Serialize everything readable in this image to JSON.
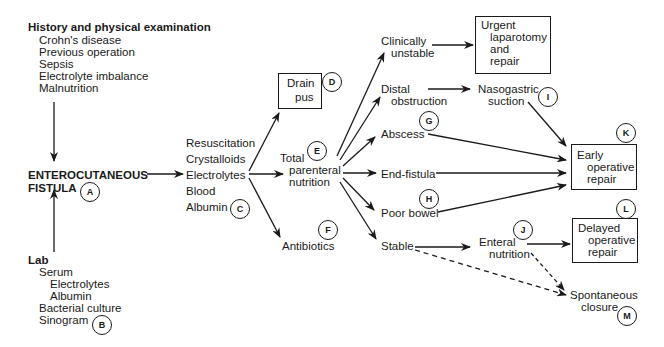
{
  "history": {
    "title": "History and physical examination",
    "items": [
      "Crohn's disease",
      "Previous operation",
      "Sepsis",
      "Electrolyte imbalance",
      "Malnutrition"
    ]
  },
  "fistula": {
    "line1": "ENTEROCUTANEOUS",
    "line2": "FISTULA",
    "label": "A"
  },
  "lab": {
    "title": "Lab",
    "serum": "Serum",
    "serum_items": [
      "Electrolytes",
      "Albumin"
    ],
    "items": [
      "Bacterial culture",
      "Sinogram"
    ],
    "label": "B"
  },
  "resuscitation": {
    "items": [
      "Resuscitation",
      "Crystalloids",
      "Electrolytes",
      "Blood",
      "Albumin"
    ],
    "label": "C"
  },
  "drain": {
    "line1": "Drain",
    "line2": "pus",
    "label": "D"
  },
  "tpn": {
    "line1": "Total",
    "line2": "parenteral",
    "line3": "nutrition",
    "label": "E"
  },
  "antibiotics": {
    "text": "Antibiotics",
    "label": "F"
  },
  "branches": {
    "unstable": {
      "line1": "Clinically",
      "line2": "unstable"
    },
    "obstruction": {
      "line1": "Distal",
      "line2": "obstruction"
    },
    "abscess": {
      "text": "Abscess",
      "label": "G"
    },
    "endfistula": {
      "text": "End-fistula"
    },
    "poorbowel": {
      "text": "Poor bowel",
      "label": "H"
    },
    "stable": {
      "text": "Stable"
    }
  },
  "urgent": {
    "line1": "Urgent",
    "line2": "laparotomy",
    "line3": "and",
    "line4": "repair"
  },
  "nasogastric": {
    "line1": "Nasogastric",
    "line2": "suction",
    "label": "I"
  },
  "enteral": {
    "line1": "Enteral",
    "line2": "nutrition",
    "label": "J"
  },
  "early": {
    "line1": "Early",
    "line2": "operative",
    "line3": "repair",
    "label": "K"
  },
  "delayed": {
    "line1": "Delayed",
    "line2": "operative",
    "line3": "repair",
    "label": "L"
  },
  "spontaneous": {
    "line1": "Spontaneous",
    "line2": "closure",
    "label": "M"
  }
}
